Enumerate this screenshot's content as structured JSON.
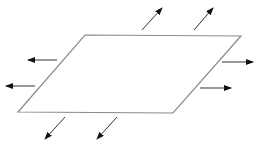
{
  "diagram": {
    "colors": {
      "shape_stroke": "#8a8a8a",
      "arrow_stroke": "#333333",
      "arrow_head": "#111111",
      "background": "#ffffff"
    },
    "shape": {
      "type": "parallelogram",
      "points": [
        [
          85,
          35
        ],
        [
          241,
          36
        ],
        [
          173,
          113
        ],
        [
          18,
          112
        ]
      ]
    },
    "arrows": [
      {
        "side": "top",
        "from": [
          142,
          30
        ],
        "to": [
          162,
          8
        ]
      },
      {
        "side": "top",
        "from": [
          194,
          30
        ],
        "to": [
          213,
          8
        ]
      },
      {
        "side": "right",
        "from": [
          222,
          62
        ],
        "to": [
          253,
          62
        ]
      },
      {
        "side": "right",
        "from": [
          200,
          88
        ],
        "to": [
          231,
          88
        ]
      },
      {
        "side": "bottom",
        "from": [
          65,
          117
        ],
        "to": [
          45,
          139
        ]
      },
      {
        "side": "bottom",
        "from": [
          117,
          117
        ],
        "to": [
          97,
          139
        ]
      },
      {
        "side": "left",
        "from": [
          57,
          60
        ],
        "to": [
          28,
          60
        ]
      },
      {
        "side": "left",
        "from": [
          35,
          86
        ],
        "to": [
          6,
          86
        ]
      }
    ]
  }
}
